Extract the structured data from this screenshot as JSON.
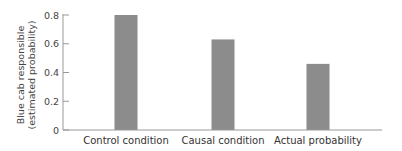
{
  "chart_data": {
    "type": "bar",
    "title": "",
    "xlabel": "",
    "ylabel": [
      "Blue cab responsible",
      "(estimated probability)"
    ],
    "categories": [
      "Control condition",
      "Causal condition",
      "Actual probability"
    ],
    "values": [
      0.8,
      0.63,
      0.46
    ],
    "ylim": [
      0,
      0.8
    ],
    "yticks": [
      0,
      0.2,
      0.4,
      0.6,
      0.8
    ],
    "ytick_labels": [
      "0",
      "0.2",
      "0.4",
      "0.6",
      "0.8"
    ],
    "grid": false,
    "legend": null,
    "colors": {
      "bar": "#8c8c8c",
      "axis": "#999999"
    }
  }
}
